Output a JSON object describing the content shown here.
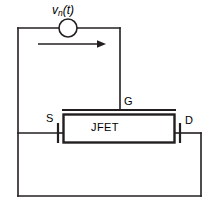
{
  "figure": {
    "background_color": "#ffffff",
    "line_color": "#231f20",
    "text_color": "#000000"
  },
  "labels": {
    "source_voltage": "v",
    "source_voltage_sub": "n",
    "source_voltage_arg": "(t)",
    "gate": "G",
    "source_terminal": "S",
    "drain_terminal": "D",
    "device": "JFET"
  },
  "components": {
    "voltage_source": {
      "name": "voltage-source-symbol",
      "shape": "circle",
      "cx": 68,
      "cy": 28,
      "r": 9
    },
    "current_arrow": {
      "name": "current-direction-arrow",
      "direction": "right",
      "x1": 38,
      "x2": 100,
      "y": 44
    },
    "jfet_body": {
      "name": "jfet-body-rectangle",
      "x": 63,
      "y": 114,
      "width": 112,
      "height": 29
    },
    "gate_bar": {
      "name": "gate-bar",
      "x1": 62,
      "x2": 176,
      "y": 110
    }
  },
  "wires": [
    {
      "name": "top-wire-left",
      "from": [
        18,
        28
      ],
      "to": [
        59,
        28
      ]
    },
    {
      "name": "top-wire-right",
      "from": [
        77,
        28
      ],
      "to": [
        120,
        28
      ]
    },
    {
      "name": "gate-lead-vertical",
      "from": [
        120,
        28
      ],
      "to": [
        120,
        110
      ]
    },
    {
      "name": "left-vertical-wire",
      "from": [
        18,
        28
      ],
      "to": [
        18,
        196
      ]
    },
    {
      "name": "source-lead-horizontal",
      "from": [
        18,
        133
      ],
      "to": [
        58,
        133
      ]
    },
    {
      "name": "source-terminal-tick",
      "from": [
        58,
        124
      ],
      "to": [
        58,
        142
      ]
    },
    {
      "name": "source-tick-to-body",
      "from": [
        58,
        133
      ],
      "to": [
        63,
        133
      ]
    },
    {
      "name": "drain-tick-to-body",
      "from": [
        175,
        133
      ],
      "to": [
        180,
        133
      ]
    },
    {
      "name": "drain-terminal-tick",
      "from": [
        180,
        124
      ],
      "to": [
        180,
        142
      ]
    },
    {
      "name": "drain-lead-horizontal",
      "from": [
        180,
        133
      ],
      "to": [
        201,
        133
      ]
    },
    {
      "name": "right-vertical-wire",
      "from": [
        201,
        133
      ],
      "to": [
        201,
        196
      ]
    },
    {
      "name": "bottom-wire",
      "from": [
        18,
        196
      ],
      "to": [
        201,
        196
      ]
    }
  ]
}
